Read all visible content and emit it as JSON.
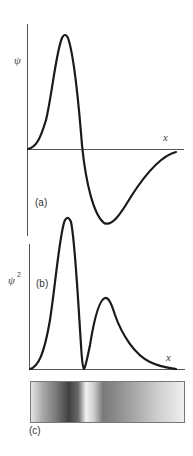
{
  "figure": {
    "panel_a": {
      "label": "(a)",
      "ylabel": "ψ",
      "xlabel": "x",
      "description": "Radial wavefunction with one node: positive lobe then negative lobe decaying to zero"
    },
    "panel_b": {
      "label": "(b)",
      "ylabel": "ψ",
      "ylabel_superscript": "2",
      "xlabel": "x",
      "description": "Probability density: tall peak, node at zero, smaller second peak decaying"
    },
    "panel_c": {
      "label": "(c)",
      "description": "Grayscale density band: dark where probability high, light at node"
    },
    "colors": {
      "curve": "#1a1a1a",
      "axis": "#555555",
      "band_dark": "#3a3a3a",
      "band_light": "#f4f4f4"
    }
  }
}
